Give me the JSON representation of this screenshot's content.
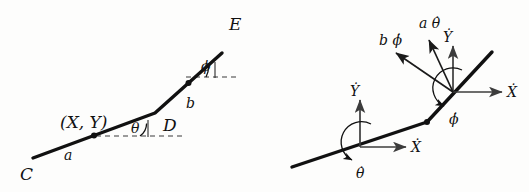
{
  "figure": {
    "background_color": "#fdfdfc",
    "ink_color": "#111111"
  },
  "left_diagram": {
    "name": "geometry-diagram",
    "points": {
      "C": {
        "label": "C",
        "x": 33,
        "y": 158
      },
      "D": {
        "label": "D",
        "x": 155,
        "y": 113
      },
      "E": {
        "label": "E",
        "x": 222,
        "y": 53
      }
    },
    "segment_labels": {
      "a": "a",
      "b": "b"
    },
    "angle_labels": {
      "theta": "θ",
      "phi": "ϕ"
    },
    "coordinate_label": "(X, Y)",
    "endpoint_labels": {
      "C": "C",
      "D": "D",
      "E": "E"
    }
  },
  "right_diagram": {
    "name": "velocity-diagram",
    "lower_node": {
      "x_dot": "Ẋ",
      "y_dot": "Ẏ",
      "theta_dot": "θ̇"
    },
    "upper_node": {
      "x_dot": "Ẋ",
      "y_dot": "Ẏ",
      "phi_dot": "ϕ̇",
      "a_theta_dot": "a θ̇",
      "b_phi_dot": "b ϕ̇"
    }
  },
  "icons": {
    "arrowhead": "arrowhead-icon",
    "rotation_arc": "rotation-arc-icon",
    "node_dot": "node-dot-icon"
  }
}
